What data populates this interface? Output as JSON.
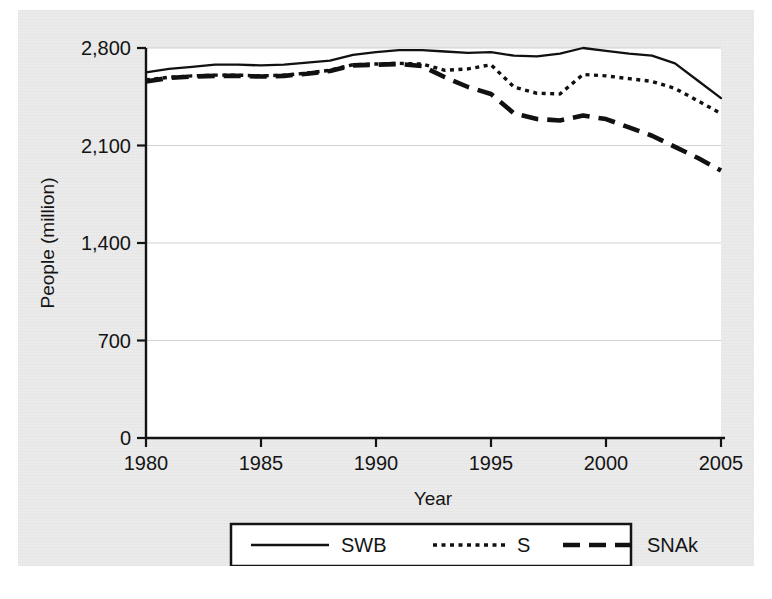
{
  "chart_data": {
    "type": "line",
    "title": "",
    "xlabel": "Year",
    "ylabel": "People (million)",
    "xlim": [
      1980,
      2005
    ],
    "ylim": [
      0,
      2800
    ],
    "grid": true,
    "legend_position": "bottom",
    "x_ticks": [
      "1980",
      "1985",
      "1990",
      "1995",
      "2000",
      "2005"
    ],
    "y_ticks": [
      "0",
      "700",
      "1,400",
      "2,100",
      "2,800"
    ],
    "x_tick_values": [
      1980,
      1985,
      1990,
      1995,
      2000,
      2005
    ],
    "y_tick_values": [
      0,
      700,
      1400,
      2100,
      2800
    ],
    "x": [
      1980,
      1981,
      1982,
      1983,
      1984,
      1985,
      1986,
      1987,
      1988,
      1989,
      1990,
      1991,
      1992,
      1993,
      1994,
      1995,
      1996,
      1997,
      1998,
      1999,
      2000,
      2001,
      2002,
      2003,
      2004,
      2005
    ],
    "series": [
      {
        "name": "SWB",
        "style": "solid",
        "values": [
          2625,
          2650,
          2665,
          2680,
          2680,
          2675,
          2680,
          2695,
          2710,
          2750,
          2770,
          2785,
          2785,
          2775,
          2765,
          2770,
          2745,
          2740,
          2760,
          2800,
          2780,
          2760,
          2745,
          2690,
          2565,
          2440
        ]
      },
      {
        "name": "S",
        "style": "dotted",
        "values": [
          2570,
          2590,
          2600,
          2605,
          2605,
          2600,
          2605,
          2620,
          2640,
          2680,
          2685,
          2690,
          2685,
          2640,
          2650,
          2680,
          2520,
          2475,
          2470,
          2610,
          2600,
          2580,
          2560,
          2510,
          2420,
          2330
        ]
      },
      {
        "name": "SNAk",
        "style": "dashed",
        "values": [
          2560,
          2585,
          2595,
          2600,
          2600,
          2595,
          2600,
          2615,
          2635,
          2675,
          2680,
          2685,
          2670,
          2590,
          2520,
          2470,
          2330,
          2290,
          2280,
          2315,
          2290,
          2230,
          2170,
          2090,
          2010,
          1920
        ]
      }
    ]
  },
  "legend": {
    "items": [
      {
        "label": "SWB",
        "style": "solid"
      },
      {
        "label": "S",
        "style": "dotted"
      },
      {
        "label": "SNAk",
        "style": "dashed"
      }
    ]
  }
}
